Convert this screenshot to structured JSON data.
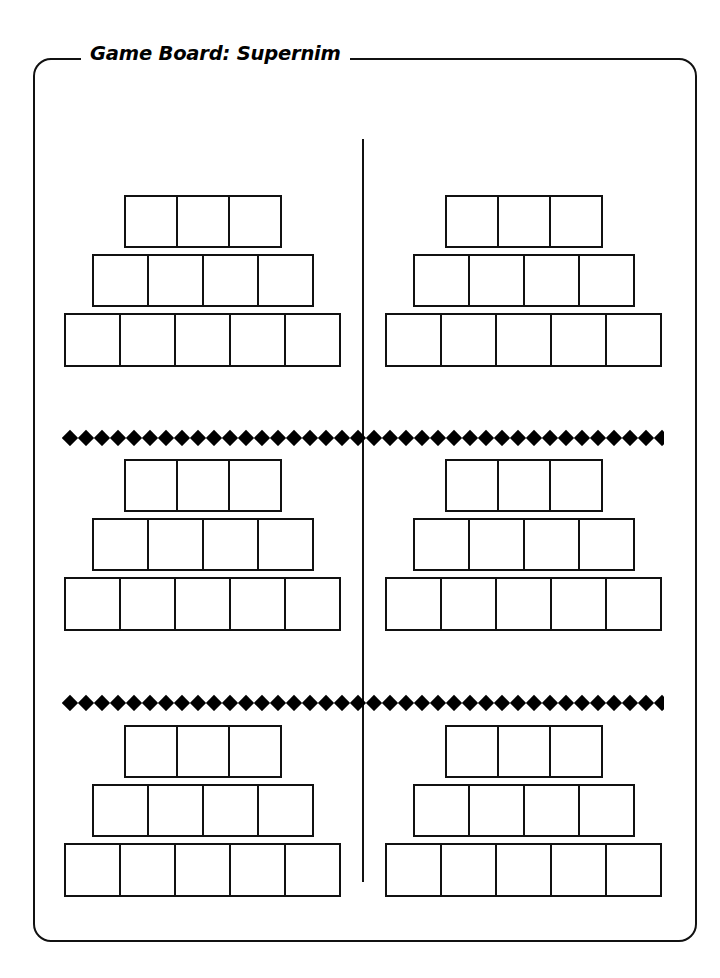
{
  "page": {
    "title": "Game Board: Supernim",
    "background_color": "#ffffff",
    "ink_color": "#000000"
  },
  "worksheet": {
    "title": "Game Board: Supernim",
    "border_style": "rounded-rectangle-with-title-notch"
  },
  "board": {
    "description": "Six identical triangular game boards arranged in a 3-row by 2-column grid, separated by a vertical rule and two horizontal diamond dividers.",
    "columns": 2,
    "rows": 3,
    "total_boards": 6,
    "pyramid": {
      "rows": [
        {
          "label": "top-row",
          "cells": 3
        },
        {
          "label": "middle-row",
          "cells": 4
        },
        {
          "label": "bottom-row",
          "cells": 5
        }
      ],
      "total_cells_per_board": 12
    },
    "sections": [
      {
        "name": "section-top",
        "boards": [
          {
            "name": "board-top-left",
            "side": "left"
          },
          {
            "name": "board-top-right",
            "side": "right"
          }
        ]
      },
      {
        "name": "section-middle",
        "boards": [
          {
            "name": "board-middle-left",
            "side": "left"
          },
          {
            "name": "board-middle-right",
            "side": "right"
          }
        ]
      },
      {
        "name": "section-bottom",
        "boards": [
          {
            "name": "board-bottom-left",
            "side": "left"
          },
          {
            "name": "board-bottom-right",
            "side": "right"
          }
        ]
      }
    ],
    "dividers": [
      {
        "name": "divider-1",
        "style": "diamond-row",
        "diamond_count": 38
      },
      {
        "name": "divider-2",
        "style": "diamond-row",
        "diamond_count": 38
      }
    ],
    "center_rule": {
      "name": "center-rule",
      "orientation": "vertical"
    }
  }
}
